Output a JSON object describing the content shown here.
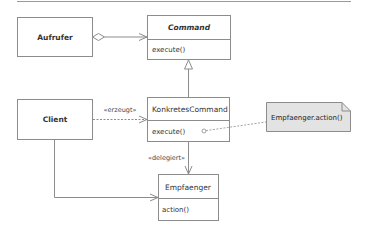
{
  "diagram": {
    "type": "UML class diagram",
    "pattern": "Command",
    "colors": {
      "line": "#8c8c8c",
      "box_fill": "#ffffff",
      "note_fill": "#e3e3e3",
      "text": "#333333"
    },
    "classes": {
      "aufrufer": {
        "name": "Aufrufer",
        "style": "bold"
      },
      "command": {
        "name": "Command",
        "style": "bold-italic",
        "operations": [
          "execute()"
        ]
      },
      "client": {
        "name": "Client",
        "style": "bold"
      },
      "konkretes_command": {
        "name": "KonkretesCommand",
        "style": "normal",
        "operations": [
          "execute()"
        ]
      },
      "empfaenger": {
        "name": "Empfaenger",
        "style": "normal",
        "operations": [
          "action()"
        ]
      }
    },
    "relations": {
      "aggregation": {
        "from": "Aufrufer",
        "to": "Command",
        "kind": "aggregation"
      },
      "inheritance": {
        "from": "KonkretesCommand",
        "to": "Command",
        "kind": "generalization"
      },
      "creates": {
        "from": "Client",
        "to": "KonkretesCommand",
        "kind": "dependency",
        "label": "«erzeugt»"
      },
      "delegates": {
        "from": "KonkretesCommand",
        "to": "Empfaenger",
        "kind": "association",
        "label": "«delegiert»"
      },
      "client_receiver": {
        "from": "Client",
        "to": "Empfaenger",
        "kind": "association"
      }
    },
    "note": {
      "text": "Empfaenger.action()",
      "attached_to": "KonkretesCommand.execute()"
    }
  }
}
